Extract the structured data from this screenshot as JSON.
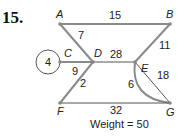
{
  "problem": {
    "number": "15."
  },
  "nodes": {
    "A": "A",
    "B": "B",
    "C": "C",
    "D": "D",
    "E": "E",
    "F": "F",
    "G": "G"
  },
  "edges": [
    {
      "from": "A",
      "to": "B",
      "weight": "15"
    },
    {
      "from": "A",
      "to": "D",
      "weight": "7"
    },
    {
      "from": "C",
      "to": "C",
      "weight": "4",
      "type": "loop"
    },
    {
      "from": "C",
      "to": "D",
      "weight": "9"
    },
    {
      "from": "D",
      "to": "E",
      "weight": "28"
    },
    {
      "from": "B",
      "to": "E",
      "weight": "11"
    },
    {
      "from": "D",
      "to": "F",
      "weight": "2"
    },
    {
      "from": "E",
      "to": "G",
      "weight": "6",
      "type": "curved"
    },
    {
      "from": "E",
      "to": "G",
      "weight": "18"
    },
    {
      "from": "F",
      "to": "G",
      "weight": "32"
    }
  ],
  "total": {
    "label": "Weight = 50"
  }
}
